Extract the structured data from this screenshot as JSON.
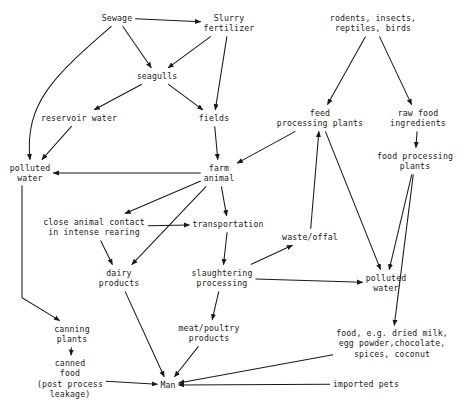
{
  "diagram": {
    "type": "flow-diagram",
    "stroke_color": "#1a1a1a",
    "background_color": "#ffffff",
    "nodes": [
      {
        "id": "sewage",
        "label": "Sewage",
        "x": 117,
        "y": 18
      },
      {
        "id": "slurry",
        "label": "Slurry\nfertilizer",
        "x": 229,
        "y": 23
      },
      {
        "id": "rodents",
        "label": "rodents, insects,\nreptiles, birds",
        "x": 373,
        "y": 23
      },
      {
        "id": "seagulls",
        "label": "seagulls",
        "x": 157,
        "y": 76
      },
      {
        "id": "reservoir",
        "label": "reservoir water",
        "x": 79,
        "y": 118
      },
      {
        "id": "fields",
        "label": "fields",
        "x": 214,
        "y": 118
      },
      {
        "id": "feed-plants",
        "label": "feed\nprocessing plants",
        "x": 320,
        "y": 118
      },
      {
        "id": "raw-food",
        "label": "raw food\ningredients",
        "x": 418,
        "y": 118
      },
      {
        "id": "polluted-left",
        "label": "polluted\nwater",
        "x": 30,
        "y": 173
      },
      {
        "id": "farm-animal",
        "label": "farm\nanimal",
        "x": 219,
        "y": 173
      },
      {
        "id": "food-plants",
        "label": "food processing\nplants",
        "x": 415,
        "y": 161
      },
      {
        "id": "close-contact",
        "label": "close animal contact\nin intense rearing",
        "x": 94,
        "y": 227
      },
      {
        "id": "transportation",
        "label": "transportation",
        "x": 228,
        "y": 224
      },
      {
        "id": "waste-offal",
        "label": "waste/offal",
        "x": 310,
        "y": 237
      },
      {
        "id": "dairy",
        "label": "dairy\nproducts",
        "x": 119,
        "y": 278
      },
      {
        "id": "slaughtering",
        "label": "slaughtering\nprocessing",
        "x": 222,
        "y": 278
      },
      {
        "id": "polluted-right",
        "label": "polluted\nwater",
        "x": 386,
        "y": 283
      },
      {
        "id": "canning",
        "label": "canning\nplants",
        "x": 72,
        "y": 334
      },
      {
        "id": "meat",
        "label": "meat/poultry\nproducts",
        "x": 209,
        "y": 333
      },
      {
        "id": "food-examples",
        "label": "food, e.g. dried milk,\negg powder,chocolate,\nspices, coconut",
        "x": 392,
        "y": 344
      },
      {
        "id": "canned-food",
        "label": "canned\nfood\n(post process\nleakage)",
        "x": 70,
        "y": 379
      },
      {
        "id": "man",
        "label": "Man",
        "x": 168,
        "y": 385
      },
      {
        "id": "imported-pets",
        "label": "imported pets",
        "x": 366,
        "y": 384
      }
    ],
    "edges": [
      {
        "from": "sewage",
        "to": "slurry",
        "style": "straight"
      },
      {
        "from": "sewage",
        "to": "seagulls",
        "style": "straight"
      },
      {
        "from": "sewage",
        "to": "polluted-left",
        "style": "curved"
      },
      {
        "from": "slurry",
        "to": "seagulls",
        "style": "straight"
      },
      {
        "from": "slurry",
        "to": "fields",
        "style": "straight"
      },
      {
        "from": "seagulls",
        "to": "reservoir",
        "style": "straight"
      },
      {
        "from": "seagulls",
        "to": "fields",
        "style": "straight"
      },
      {
        "from": "reservoir",
        "to": "polluted-left",
        "style": "straight"
      },
      {
        "from": "fields",
        "to": "farm-animal",
        "style": "straight"
      },
      {
        "from": "rodents",
        "to": "feed-plants",
        "style": "straight"
      },
      {
        "from": "rodents",
        "to": "raw-food",
        "style": "straight"
      },
      {
        "from": "raw-food",
        "to": "food-plants",
        "style": "straight"
      },
      {
        "from": "feed-plants",
        "to": "farm-animal",
        "style": "straight"
      },
      {
        "from": "feed-plants",
        "to": "polluted-right",
        "style": "straight"
      },
      {
        "from": "food-plants",
        "to": "polluted-right",
        "style": "straight"
      },
      {
        "from": "food-plants",
        "to": "food-examples",
        "style": "straight"
      },
      {
        "from": "farm-animal",
        "to": "polluted-left",
        "style": "straight"
      },
      {
        "from": "farm-animal",
        "to": "close-contact",
        "style": "straight"
      },
      {
        "from": "farm-animal",
        "to": "transportation",
        "style": "straight"
      },
      {
        "from": "farm-animal",
        "to": "dairy",
        "style": "straight"
      },
      {
        "from": "close-contact",
        "to": "transportation",
        "style": "straight"
      },
      {
        "from": "close-contact",
        "to": "dairy",
        "style": "straight"
      },
      {
        "from": "transportation",
        "to": "slaughtering",
        "style": "straight"
      },
      {
        "from": "waste-offal",
        "to": "feed-plants",
        "style": "straight"
      },
      {
        "from": "slaughtering",
        "to": "waste-offal",
        "style": "straight"
      },
      {
        "from": "slaughtering",
        "to": "polluted-right",
        "style": "straight"
      },
      {
        "from": "slaughtering",
        "to": "meat",
        "style": "straight"
      },
      {
        "from": "polluted-left",
        "to": "canning",
        "style": "elbow"
      },
      {
        "from": "canning",
        "to": "canned-food",
        "style": "straight"
      },
      {
        "from": "dairy",
        "to": "man",
        "style": "straight"
      },
      {
        "from": "meat",
        "to": "man",
        "style": "straight"
      },
      {
        "from": "canned-food",
        "to": "man",
        "style": "straight"
      },
      {
        "from": "food-examples",
        "to": "man",
        "style": "straight"
      },
      {
        "from": "imported-pets",
        "to": "man",
        "style": "straight"
      }
    ]
  }
}
